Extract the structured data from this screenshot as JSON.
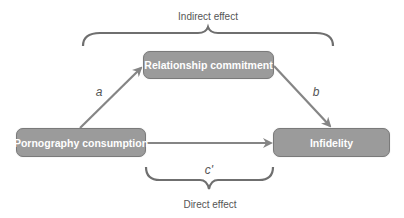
{
  "diagram": {
    "type": "mediation-model",
    "nodes": {
      "mediator": "Relationship commitment",
      "predictor": "Pornography consumption",
      "outcome": "Infidelity"
    },
    "paths": {
      "a": "a",
      "b": "b",
      "c_prime": "c'"
    },
    "braces": {
      "indirect": "Indirect effect",
      "direct": "Direct effect"
    },
    "colors": {
      "node_fill": "#9b9b9b",
      "node_border": "#7a7a7a",
      "node_text": "#ffffff",
      "arrow": "#858585",
      "label_text": "#555555"
    }
  }
}
